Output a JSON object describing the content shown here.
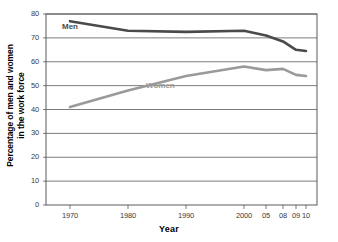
{
  "chart_data": {
    "type": "line",
    "title": "",
    "xlabel": "Year",
    "ylabel": "Percentage of men and women in the work force",
    "ylabel_line1": "Percentage of men and women",
    "ylabel_line2": "in the work force",
    "categories": [
      "1970",
      "1980",
      "1990",
      "2000",
      "05",
      "08",
      "09",
      "10"
    ],
    "x_tick_labels": [
      "1970",
      "1980",
      "1990",
      "2000",
      "05",
      "08",
      "09",
      "10"
    ],
    "y_tick_labels": [
      "0",
      "10",
      "20",
      "30",
      "40",
      "50",
      "60",
      "70",
      "80"
    ],
    "y_ticks": [
      0,
      10,
      20,
      30,
      40,
      50,
      60,
      70,
      80
    ],
    "ylim": [
      0,
      80
    ],
    "grid": true,
    "legend_position": "inline-labels",
    "series": [
      {
        "name": "Men",
        "label": "Men",
        "color": "#4a4a4a",
        "values": [
          77,
          73,
          72.5,
          73,
          71,
          68.5,
          65,
          64.5
        ]
      },
      {
        "name": "Women",
        "label": "Women",
        "color": "#9a9a9a",
        "values": [
          41,
          48,
          54,
          58,
          56.5,
          57,
          54.5,
          54
        ]
      }
    ]
  }
}
